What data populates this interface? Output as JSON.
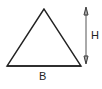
{
  "diagram": {
    "shape": "triangle",
    "labels": {
      "base": "B",
      "height": "H"
    },
    "colors": {
      "stroke": "#222222",
      "arrow": "#555555"
    }
  }
}
